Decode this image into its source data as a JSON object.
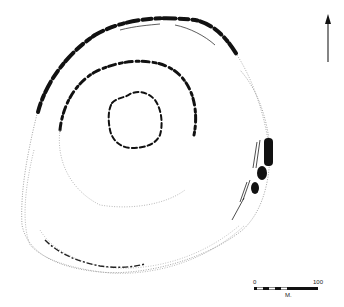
{
  "diagram": {
    "type": "archaeological site plan",
    "colors": {
      "ink": "#111111",
      "dotted": "#8a8a8a",
      "background": "#ffffff"
    }
  },
  "north_arrow": {
    "icon": "north-arrow-icon",
    "direction": "up"
  },
  "scale_bar": {
    "start_label": "0",
    "end_label": "100",
    "unit_label": "M."
  }
}
